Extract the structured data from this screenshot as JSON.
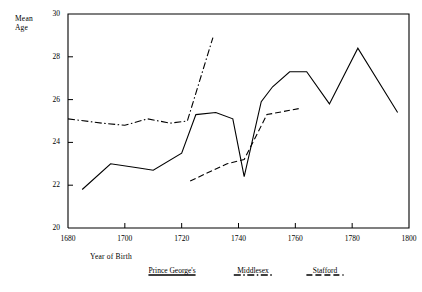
{
  "chart_data": {
    "type": "line",
    "title": "",
    "xlabel": "Year of Birth",
    "ylabel": "Mean Age",
    "xlim": [
      1680,
      1800
    ],
    "ylim": [
      20,
      30
    ],
    "xticks": [
      1680,
      1700,
      1720,
      1740,
      1760,
      1780,
      1800
    ],
    "yticks": [
      20,
      22,
      24,
      26,
      28,
      30
    ],
    "grid": false,
    "legend_position": "bottom",
    "series": [
      {
        "name": "Prince George's",
        "style": "solid",
        "color": "#000000",
        "points": [
          [
            1685,
            21.8
          ],
          [
            1695,
            23.0
          ],
          [
            1705,
            22.8
          ],
          [
            1710,
            22.7
          ],
          [
            1720,
            23.5
          ],
          [
            1725,
            25.3
          ],
          [
            1732,
            25.4
          ],
          [
            1738,
            25.1
          ],
          [
            1742,
            22.4
          ],
          [
            1748,
            25.9
          ],
          [
            1752,
            26.6
          ],
          [
            1758,
            27.3
          ],
          [
            1764,
            27.3
          ],
          [
            1772,
            25.8
          ],
          [
            1782,
            28.4
          ],
          [
            1796,
            25.4
          ]
        ]
      },
      {
        "name": "Middlesex",
        "style": "dash-dot",
        "color": "#000000",
        "points": [
          [
            1680,
            25.1
          ],
          [
            1692,
            24.9
          ],
          [
            1700,
            24.8
          ],
          [
            1708,
            25.1
          ],
          [
            1716,
            24.9
          ],
          [
            1722,
            25.0
          ],
          [
            1731,
            28.9
          ]
        ]
      },
      {
        "name": "Stafford",
        "style": "dashed",
        "color": "#000000",
        "points": [
          [
            1723,
            22.2
          ],
          [
            1736,
            23.0
          ],
          [
            1742,
            23.2
          ],
          [
            1750,
            25.3
          ],
          [
            1762,
            25.6
          ]
        ]
      }
    ]
  },
  "axis": {
    "y_label_line1": "Mean",
    "y_label_line2": "Age",
    "x_label": "Year of Birth"
  },
  "ytick_labels": [
    "20",
    "22",
    "24",
    "26",
    "28",
    "30"
  ],
  "xtick_labels": [
    "1680",
    "1700",
    "1720",
    "1740",
    "1760",
    "1780",
    "1800"
  ],
  "legend": [
    {
      "label": "Prince George's"
    },
    {
      "label": "Middlesex"
    },
    {
      "label": "Stafford"
    }
  ]
}
